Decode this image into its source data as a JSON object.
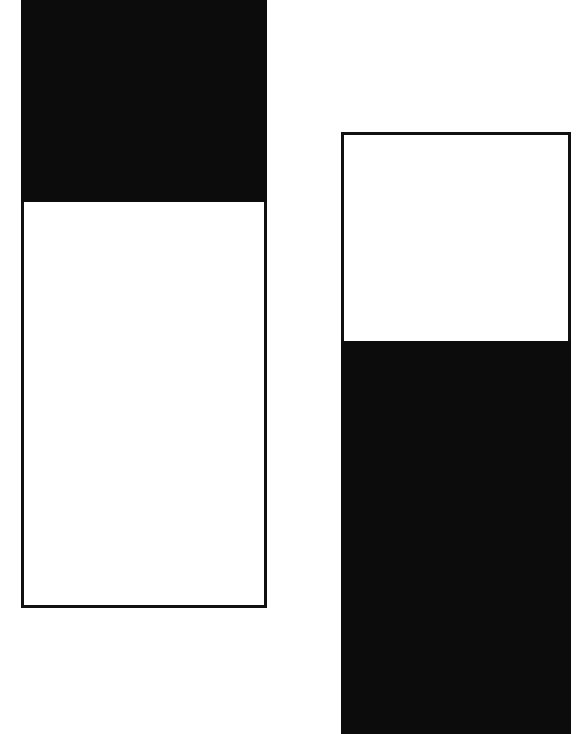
{
  "canvas": {
    "width": 576,
    "height": 734,
    "background": "#ffffff"
  },
  "colors": {
    "ink": "#0c0c0c",
    "line": "#111111",
    "paper": "#ffffff"
  },
  "shapes": {
    "left_bar": {
      "black_block": {
        "x": 21,
        "y": 0,
        "w": 246,
        "h": 202
      },
      "white_block": {
        "x": 21,
        "y": 200,
        "w": 246,
        "h": 408
      }
    },
    "right_bar": {
      "white_block": {
        "x": 341,
        "y": 132,
        "w": 230,
        "h": 212
      },
      "black_block": {
        "x": 341,
        "y": 341,
        "w": 230,
        "h": 393
      }
    }
  }
}
